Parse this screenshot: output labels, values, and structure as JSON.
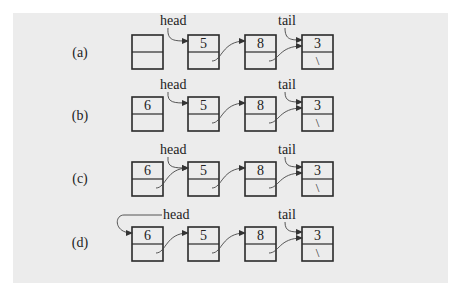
{
  "figure": {
    "background_color": "#ececec",
    "node_stroke_color": "#2a2a2a",
    "node_width": 31,
    "node_height": 34,
    "rows": [
      {
        "label": "(a)",
        "label_y": 57,
        "node_top": 35,
        "nodes": [
          {
            "x": 132,
            "value": "",
            "next": ""
          },
          {
            "x": 188,
            "value": "5",
            "next": ""
          },
          {
            "x": 245,
            "value": "8",
            "next": ""
          },
          {
            "x": 302,
            "value": "3",
            "next": "\\"
          }
        ],
        "links": [
          [
            1,
            2
          ],
          [
            2,
            3
          ]
        ],
        "head": {
          "text": "head",
          "text_x": 160,
          "text_y": 25,
          "target": 1,
          "style": "curl"
        },
        "tail": {
          "text": "tail",
          "text_x": 278,
          "text_y": 25,
          "target": 3
        }
      },
      {
        "label": "(b)",
        "label_y": 120,
        "node_top": 97,
        "nodes": [
          {
            "x": 132,
            "value": "6",
            "next": ""
          },
          {
            "x": 188,
            "value": "5",
            "next": ""
          },
          {
            "x": 245,
            "value": "8",
            "next": ""
          },
          {
            "x": 302,
            "value": "3",
            "next": "\\"
          }
        ],
        "links": [
          [
            1,
            2
          ],
          [
            2,
            3
          ]
        ],
        "head": {
          "text": "head",
          "text_x": 160,
          "text_y": 89,
          "target": 1,
          "style": "curl"
        },
        "tail": {
          "text": "tail",
          "text_x": 278,
          "text_y": 89,
          "target": 3
        }
      },
      {
        "label": "(c)",
        "label_y": 183,
        "node_top": 162,
        "nodes": [
          {
            "x": 132,
            "value": "6",
            "next": ""
          },
          {
            "x": 188,
            "value": "5",
            "next": ""
          },
          {
            "x": 245,
            "value": "8",
            "next": ""
          },
          {
            "x": 302,
            "value": "3",
            "next": "\\"
          }
        ],
        "links": [
          [
            0,
            1
          ],
          [
            1,
            2
          ],
          [
            2,
            3
          ]
        ],
        "head": {
          "text": "head",
          "text_x": 160,
          "text_y": 154,
          "target": 1,
          "style": "curl"
        },
        "tail": {
          "text": "tail",
          "text_x": 278,
          "text_y": 154,
          "target": 3
        }
      },
      {
        "label": "(d)",
        "label_y": 247,
        "node_top": 227,
        "nodes": [
          {
            "x": 132,
            "value": "6",
            "next": ""
          },
          {
            "x": 188,
            "value": "5",
            "next": ""
          },
          {
            "x": 245,
            "value": "8",
            "next": ""
          },
          {
            "x": 302,
            "value": "3",
            "next": "\\"
          }
        ],
        "links": [
          [
            0,
            1
          ],
          [
            1,
            2
          ],
          [
            2,
            3
          ]
        ],
        "head": {
          "text": "head",
          "text_x": 163,
          "text_y": 219,
          "target": 0,
          "style": "loop"
        },
        "tail": {
          "text": "tail",
          "text_x": 278,
          "text_y": 219,
          "target": 3
        }
      }
    ]
  }
}
